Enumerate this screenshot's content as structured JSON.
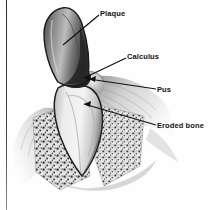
{
  "figure": {
    "kind": "medical-illustration",
    "style": "grayscale-stipple-drawing",
    "width": 219,
    "height": 210,
    "background_color": "#fefefe",
    "border": {
      "name": "left-rule",
      "color": "#2b2b2b",
      "x": 6,
      "width": 1
    }
  },
  "labels": [
    {
      "id": "plaque",
      "text": "Plaque",
      "x": 100,
      "y": 9,
      "leader": {
        "from_x": 99,
        "from_y": 15,
        "to_x": 63,
        "to_y": 45,
        "arrowhead": false
      }
    },
    {
      "id": "calculus",
      "text": "Calculus",
      "x": 127,
      "y": 52,
      "leader": {
        "from_x": 126,
        "from_y": 58,
        "to_x": 84,
        "to_y": 78,
        "arrowhead": true
      }
    },
    {
      "id": "pus",
      "text": "Pus",
      "x": 157,
      "y": 85,
      "leader": {
        "from_x": 156,
        "from_y": 89,
        "to_x": 89,
        "to_y": 79,
        "arrowhead": true
      }
    },
    {
      "id": "eroded_bone",
      "text": "Eroded bone",
      "x": 157,
      "y": 121,
      "leader": {
        "from_x": 156,
        "from_y": 125,
        "to_x": 84,
        "to_y": 104,
        "arrowhead": true
      }
    }
  ],
  "anatomy": {
    "crown": {
      "name": "plaque-coated-crown",
      "color_dark": "#2f2f2f",
      "color_mid": "#6d6d6d",
      "color_light": "#c9c9c9"
    },
    "root": {
      "name": "tooth-root",
      "color_light": "#efefef",
      "color_mid": "#c4c4c4",
      "outline": "#1d1d1d"
    },
    "calculus_deposit": {
      "name": "calculus-deposit",
      "color": "#242424"
    },
    "gingiva": {
      "name": "gum-tissue",
      "color_light": "#e6e6e6",
      "color_mid": "#b4b4b4",
      "color_dark": "#8a8a8a"
    },
    "bone": {
      "name": "eroded-alveolar-bone",
      "color_fill": "#cfcfcf",
      "stipple_color": "#2a2a2a",
      "texture": "stipple-dots"
    }
  }
}
